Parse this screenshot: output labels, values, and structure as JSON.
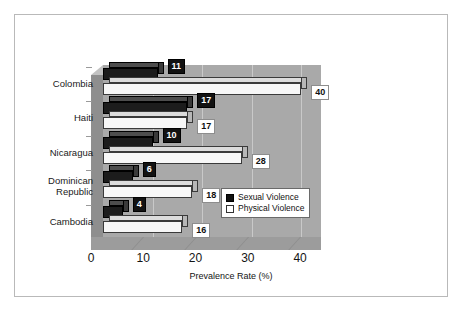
{
  "chart_data": {
    "type": "bar",
    "orientation": "horizontal",
    "title": "",
    "xlabel": "Prevalence Rate (%)",
    "ylabel": "",
    "xlim": [
      0,
      44
    ],
    "xticks": [
      0,
      10,
      20,
      30,
      40
    ],
    "xtick_labels": [
      "0",
      "10",
      "20",
      "30",
      "40"
    ],
    "grid": true,
    "legend_position": "inside-lower-right",
    "categories": [
      "Colombia",
      "Haiti",
      "Nicaragua",
      "Dominican Republic",
      "Cambodia"
    ],
    "series": [
      {
        "name": "Sexual Violence",
        "color": "#1c1c1c",
        "values": [
          11,
          17,
          10,
          6,
          4
        ]
      },
      {
        "name": "Physical Violence",
        "color": "#f7f7f7",
        "values": [
          40,
          17,
          28,
          18,
          16
        ]
      }
    ],
    "data_labels": {
      "sexual": [
        "11",
        "17",
        "10",
        "6",
        "4"
      ],
      "physical": [
        "40",
        "17",
        "28",
        "18",
        "16"
      ]
    }
  },
  "axis": {
    "xtick_0": "0",
    "xtick_1": "10",
    "xtick_2": "20",
    "xtick_3": "30",
    "xtick_4": "40",
    "title": "Prevalence Rate (%)"
  },
  "categories": {
    "c0": "Colombia",
    "c1": "Haiti",
    "c2": "Nicaragua",
    "c3_line1": "Dominican",
    "c3_line2": "Republic",
    "c4": "Cambodia"
  },
  "labels": {
    "sv0": "11",
    "sv1": "17",
    "sv2": "10",
    "sv3": "6",
    "sv4": "4",
    "pv0": "40",
    "pv1": "17",
    "pv2": "28",
    "pv3": "18",
    "pv4": "16"
  },
  "legend": {
    "item0": "Sexual Violence",
    "item1": "Physical Violence"
  }
}
